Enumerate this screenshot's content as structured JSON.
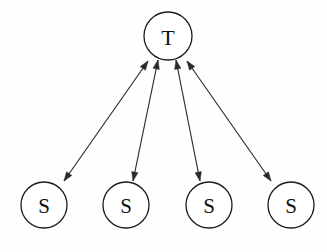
{
  "diagram": {
    "type": "hub-and-spoke-node-graph",
    "background_color": "#fefefe",
    "stroke_color": "#1b1b1b",
    "edge_color": "#2a2a2a",
    "label_color": "#111111",
    "nodes": [
      {
        "id": "T",
        "label": "T",
        "role": "target",
        "cx": 168,
        "cy": 36,
        "r": 24
      },
      {
        "id": "S1",
        "label": "S",
        "role": "source",
        "cx": 44,
        "cy": 205,
        "r": 23
      },
      {
        "id": "S2",
        "label": "S",
        "role": "source",
        "cx": 126,
        "cy": 205,
        "r": 23
      },
      {
        "id": "S3",
        "label": "S",
        "role": "source",
        "cx": 209,
        "cy": 205,
        "r": 23
      },
      {
        "id": "S4",
        "label": "S",
        "role": "source",
        "cx": 291,
        "cy": 205,
        "r": 23
      }
    ],
    "edges": [
      {
        "id": "edge-s1-t",
        "from": "S1",
        "to": "T",
        "direction": "bidirectional",
        "x1": 64,
        "y1": 181,
        "x2": 148,
        "y2": 61
      },
      {
        "id": "edge-s2-t",
        "from": "S2",
        "to": "T",
        "direction": "bidirectional",
        "x1": 133,
        "y1": 181,
        "x2": 158,
        "y2": 60
      },
      {
        "id": "edge-s3-t",
        "from": "S3",
        "to": "T",
        "direction": "bidirectional",
        "x1": 200,
        "y1": 181,
        "x2": 176,
        "y2": 60
      },
      {
        "id": "edge-s4-t",
        "from": "S4",
        "to": "T",
        "direction": "bidirectional",
        "x1": 271,
        "y1": 181,
        "x2": 187,
        "y2": 61
      }
    ],
    "arrowhead": {
      "length": 9,
      "half_width": 3.2
    }
  }
}
